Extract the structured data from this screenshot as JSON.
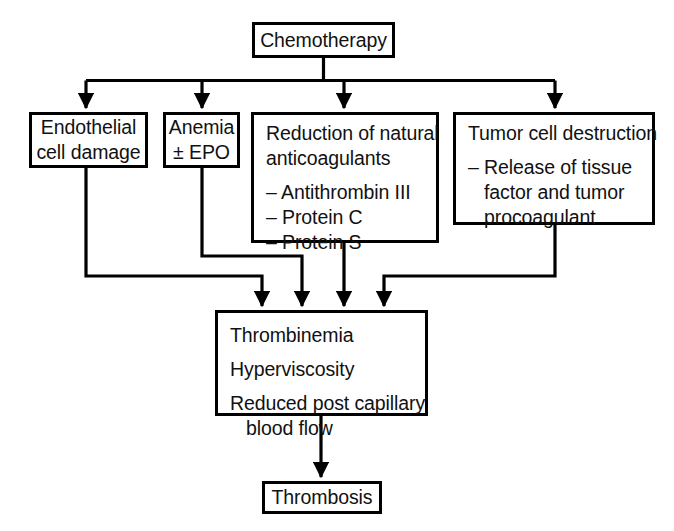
{
  "diagram": {
    "type": "flowchart",
    "orientation": "top-down",
    "line_color": "#000000",
    "box_fill": "#ffffff",
    "text_color": "#111111",
    "nodes": {
      "chemotherapy": {
        "label": "Chemotherapy"
      },
      "endothelial": {
        "line1": "Endothelial",
        "line2": "cell damage"
      },
      "anemia": {
        "line1": "Anemia",
        "line2": "± EPO"
      },
      "anticoagulants": {
        "line1": "Reduction of natural",
        "line2": "anticoagulants",
        "item1": "– Antithrombin III",
        "item2": "– Protein C",
        "item3": "– Protein S"
      },
      "tumor": {
        "line1": "Tumor cell destruction",
        "item1": "– Release of tissue",
        "item2": "factor and tumor",
        "item3": "procoagulant"
      },
      "thrombinemia": {
        "line1": "Thrombinemia",
        "line2": "Hyperviscosity",
        "line3": "Reduced post capillary",
        "line4": "blood flow"
      },
      "thrombosis": {
        "label": "Thrombosis"
      }
    },
    "edges": [
      {
        "from": "chemotherapy",
        "to": "endothelial"
      },
      {
        "from": "chemotherapy",
        "to": "anemia"
      },
      {
        "from": "chemotherapy",
        "to": "anticoagulants"
      },
      {
        "from": "chemotherapy",
        "to": "tumor"
      },
      {
        "from": "endothelial",
        "to": "thrombinemia"
      },
      {
        "from": "anemia",
        "to": "thrombinemia"
      },
      {
        "from": "anticoagulants",
        "to": "thrombinemia"
      },
      {
        "from": "tumor",
        "to": "thrombinemia"
      },
      {
        "from": "thrombinemia",
        "to": "thrombosis"
      }
    ]
  }
}
